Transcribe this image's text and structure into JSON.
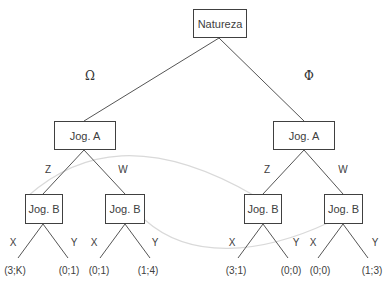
{
  "diagram": {
    "type": "extensive-form game tree",
    "root": {
      "label": "Natureza"
    },
    "nature_moves": [
      {
        "symbol": "Ω"
      },
      {
        "symbol": "Φ"
      }
    ],
    "player_a_nodes": [
      {
        "label": "Jog. A",
        "moves": [
          "Z",
          "W"
        ]
      },
      {
        "label": "Jog. A",
        "moves": [
          "Z",
          "W"
        ]
      }
    ],
    "player_b_nodes": [
      {
        "label": "Jog. B",
        "moves": [
          "X",
          "Y"
        ]
      },
      {
        "label": "Jog. B",
        "moves": [
          "X",
          "Y"
        ]
      },
      {
        "label": "Jog. B",
        "moves": [
          "X",
          "Y"
        ]
      },
      {
        "label": "Jog. B",
        "moves": [
          "X",
          "Y"
        ]
      }
    ],
    "payoffs": [
      "(3;K)",
      "(0;1)",
      "(0;1)",
      "(1;4)",
      "(3;1)",
      "(0;0)",
      "(0;0)",
      "(1;3)"
    ],
    "information_sets": [
      {
        "connects": [
          "B1",
          "B3"
        ],
        "style": "light gray curve"
      },
      {
        "connects": [
          "B2",
          "B4"
        ],
        "style": "light gray curve"
      }
    ],
    "colors": {
      "line": "#555555",
      "infoset": "#d9d9d9",
      "text": "#404040"
    }
  }
}
